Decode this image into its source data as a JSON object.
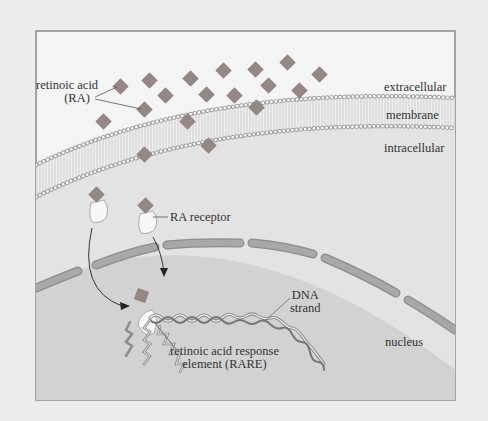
{
  "figure": {
    "type": "biology-schematic"
  },
  "labels": {
    "ra_line1": "retinoic acid",
    "ra_line2": "(RA)",
    "extracellular": "extracellular",
    "membrane": "membrane",
    "intracellular": "intracellular",
    "ra_receptor": "RA receptor",
    "dna_line1": "DNA",
    "dna_line2": "strand",
    "nucleus": "nucleus",
    "rare_line1": "retinoic acid response",
    "rare_line2": "element (RARE)"
  },
  "colors": {
    "page_background": "#ececec",
    "frame_fill": "#f4f4f4",
    "frame_border": "#8a8a8a",
    "cytoplasm": "#e3e3e3",
    "nucleoplasm": "#d2d2d2",
    "envelope_segment": "#9a9a9a",
    "retinoic_acid": "#958784",
    "membrane_bead": "#ffffff",
    "text": "#333333"
  },
  "molecules": {
    "extracellular_ra_count": 14,
    "membrane_ra_count": 4,
    "cytoplasmic_receptor_complexes": 2,
    "nuclear_receptor_complexes": 1
  }
}
